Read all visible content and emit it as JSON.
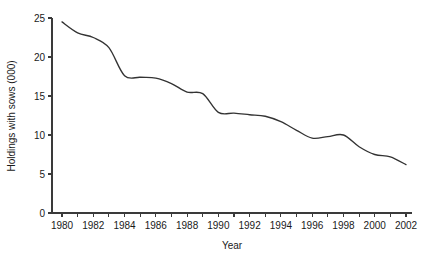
{
  "chart_data": {
    "type": "line",
    "title": "",
    "subtitle": "",
    "xlabel": "Year",
    "ylabel": "Holdings with sows (000)",
    "xlim": [
      1980,
      2002
    ],
    "ylim": [
      0,
      25
    ],
    "grid": false,
    "legend": false,
    "legend_position": "none",
    "line_color": "#333333",
    "x_tick_labels": [
      "1980",
      "1982",
      "1984",
      "1986",
      "1988",
      "1990",
      "1992",
      "1994",
      "1996",
      "1998",
      "2000",
      "2002"
    ],
    "x_tick_values": [
      1980,
      1982,
      1984,
      1986,
      1988,
      1990,
      1992,
      1994,
      1996,
      1998,
      2000,
      2002
    ],
    "x_minor_ticks": [
      1981,
      1983,
      1985,
      1987,
      1989,
      1991,
      1993,
      1995,
      1997,
      1999,
      2001
    ],
    "y_tick_labels": [
      "0",
      "5",
      "10",
      "15",
      "20",
      "25"
    ],
    "y_tick_values": [
      0,
      5,
      10,
      15,
      20,
      25
    ],
    "x": [
      1980,
      1981,
      1982,
      1983,
      1984,
      1985,
      1986,
      1987,
      1988,
      1989,
      1990,
      1991,
      1992,
      1993,
      1994,
      1995,
      1996,
      1997,
      1998,
      1999,
      2000,
      2001,
      2002
    ],
    "values": [
      24.5,
      23.1,
      22.5,
      21.2,
      17.6,
      17.4,
      17.3,
      16.6,
      15.5,
      15.3,
      12.9,
      12.8,
      12.6,
      12.4,
      11.7,
      10.6,
      9.6,
      9.8,
      10.0,
      8.5,
      7.5,
      7.2,
      6.2
    ],
    "series": [
      {
        "name": "Holdings with sows (000)",
        "values": [
          24.5,
          23.1,
          22.5,
          21.2,
          17.6,
          17.4,
          17.3,
          16.6,
          15.5,
          15.3,
          12.9,
          12.8,
          12.6,
          12.4,
          11.7,
          10.6,
          9.6,
          9.8,
          10.0,
          8.5,
          7.5,
          7.2,
          6.2
        ]
      }
    ]
  }
}
